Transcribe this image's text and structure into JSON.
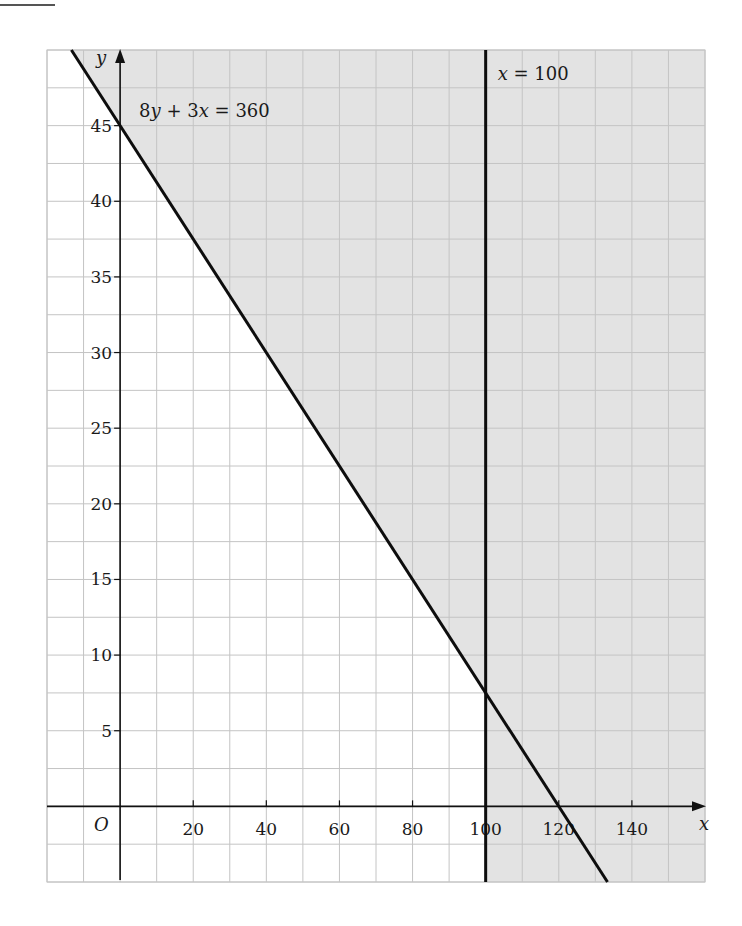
{
  "chart_data": {
    "type": "line",
    "title": "",
    "xlabel": "x",
    "ylabel": "y",
    "origin_label": "O",
    "xlim": [
      -20,
      160
    ],
    "ylim": [
      -5,
      50
    ],
    "grid": true,
    "grid_step_x": 10,
    "grid_step_y": 2.5,
    "x_ticks": [
      20,
      40,
      60,
      80,
      100,
      120,
      140
    ],
    "x_tick_labels": [
      "20",
      "40",
      "60",
      "80",
      "100",
      "120",
      "140"
    ],
    "y_ticks": [
      5,
      10,
      15,
      20,
      25,
      30,
      35,
      40,
      45
    ],
    "y_tick_labels": [
      "5",
      "10",
      "15",
      "20",
      "25",
      "30",
      "35",
      "40",
      "45"
    ],
    "series": [
      {
        "name": "8y + 3x = 360",
        "label_parts": [
          {
            "text": "8",
            "italic": false
          },
          {
            "text": "y",
            "italic": true
          },
          {
            "text": " + 3",
            "italic": false
          },
          {
            "text": "x",
            "italic": true
          },
          {
            "text": " = 360",
            "italic": false
          }
        ],
        "kind": "line",
        "points": [
          [
            -13.33,
            50
          ],
          [
            133.33,
            -5
          ]
        ],
        "intercepts": {
          "x": 120,
          "y": 45
        }
      },
      {
        "name": "x = 100",
        "label_parts": [
          {
            "text": "x",
            "italic": true
          },
          {
            "text": " = 100",
            "italic": false
          }
        ],
        "kind": "vertical",
        "points": [
          [
            100,
            -5
          ],
          [
            100,
            50
          ]
        ]
      }
    ],
    "shaded_region": {
      "description": "Shaded (rejected) region: 8y + 3x > 360 or x > 100; unshaded region is 8y + 3x <= 360 and x <= 100",
      "color": "#e3e3e3"
    },
    "intersection": [
      100,
      7.5
    ]
  },
  "colors": {
    "shade": "#e3e3e3",
    "grid": "#c4c4c4",
    "axis": "#111111",
    "line": "#0d0d0d"
  }
}
